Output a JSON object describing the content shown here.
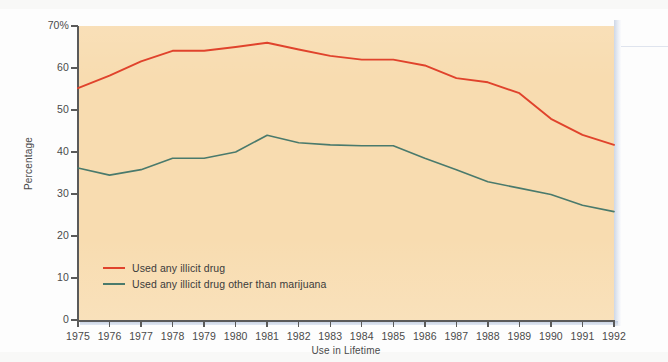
{
  "chart_data": {
    "type": "line",
    "title": "",
    "xlabel": "Use in Lifetime",
    "ylabel": "Percentage",
    "x": [
      1975,
      1976,
      1977,
      1978,
      1979,
      1980,
      1981,
      1982,
      1983,
      1984,
      1985,
      1986,
      1987,
      1988,
      1989,
      1990,
      1991,
      1992
    ],
    "categories": [
      "1975",
      "1976",
      "1977",
      "1978",
      "1979",
      "1980",
      "1981",
      "1982",
      "1983",
      "1984",
      "1985",
      "1986",
      "1987",
      "1988",
      "1989",
      "1990",
      "1991",
      "1992"
    ],
    "series": [
      {
        "name": "Used any illicit drug",
        "color": "#e0432c",
        "values": [
          55.2,
          58.2,
          61.6,
          64.1,
          64.1,
          65.0,
          66.0,
          64.4,
          62.9,
          62.0,
          62.0,
          60.6,
          57.6,
          56.6,
          54.0,
          47.9,
          44.1,
          41.7
        ]
      },
      {
        "name": "Used any illicit drug other than marijuana",
        "color": "#4a7a6c",
        "values": [
          36.2,
          34.5,
          35.8,
          38.5,
          38.5,
          40.0,
          44.0,
          42.2,
          41.7,
          41.5,
          41.5,
          38.5,
          35.8,
          32.9,
          31.4,
          29.9,
          27.3,
          25.8
        ]
      }
    ],
    "xlim": [
      1975,
      1992
    ],
    "ylim": [
      0,
      70
    ],
    "yticks": [
      "0",
      "10",
      "20",
      "30",
      "40",
      "50",
      "60",
      "70%"
    ],
    "ytick_values": [
      0,
      10,
      20,
      30,
      40,
      50,
      60,
      70
    ],
    "grid": false,
    "legend_position": "bottom-left",
    "plot_background": "#f8dcb0"
  },
  "legend": {
    "items": [
      {
        "label": "Used any illicit drug",
        "color": "#e0432c"
      },
      {
        "label": "Used any illicit drug other than marijuana",
        "color": "#4a7a6c"
      }
    ]
  },
  "axes": {
    "y_title": "Percentage",
    "x_title": "Use in Lifetime"
  }
}
